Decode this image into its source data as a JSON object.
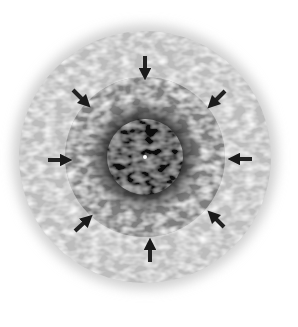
{
  "diagram": {
    "center": [
      145,
      157
    ],
    "layers": [
      {
        "name": "outer-halo",
        "radius": 132,
        "color": "#c8c8c8"
      },
      {
        "name": "middle-disk",
        "radius": 82,
        "color": "#8a8a8a"
      },
      {
        "name": "inner-core",
        "radius": 42,
        "color": "#1e1e1e"
      }
    ],
    "center_point": {
      "radius": 2,
      "color": "#ffffff"
    },
    "arrows": {
      "count": 8,
      "direction": "inward",
      "color": "#222222",
      "angles_deg": [
        -90,
        -45,
        0,
        45,
        90,
        135,
        180,
        225
      ]
    }
  }
}
